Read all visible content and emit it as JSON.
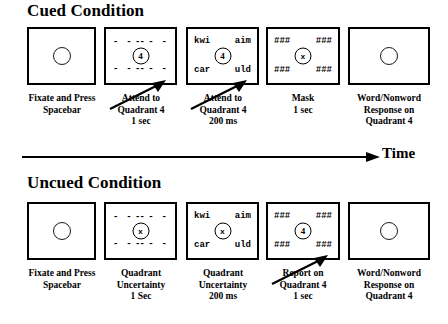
{
  "figure": {
    "time_axis_label": "Time"
  },
  "cued": {
    "title": "Cued Condition",
    "panels": [
      {
        "name": "fixation",
        "kind": "fixation",
        "center": "",
        "caption": "Fixate and Press\nSpacebar"
      },
      {
        "name": "cue",
        "kind": "dashes",
        "center": "4",
        "dashes": "- - -",
        "caption": "Attend to\nQuadrant 4\n1 sec"
      },
      {
        "name": "stimulus",
        "kind": "words",
        "center": "4",
        "words": {
          "top_left": "kwi",
          "top_right": "aim",
          "bottom_left": "car",
          "bottom_right": "uld"
        },
        "caption": "Attend to\nQuadrant 4\n200 ms"
      },
      {
        "name": "mask",
        "kind": "mask",
        "center": "x",
        "mask_token": "###",
        "caption": "Mask\n1 sec"
      },
      {
        "name": "response",
        "kind": "fixation",
        "center": "",
        "caption": "Word/Nonword\nResponse on\nQuadrant 4"
      }
    ]
  },
  "uncued": {
    "title": "Uncued Condition",
    "panels": [
      {
        "name": "fixation",
        "kind": "fixation",
        "center": "",
        "caption": "Fixate and Press\nSpacebar"
      },
      {
        "name": "cue",
        "kind": "dashes",
        "center": "x",
        "dashes": "- - -",
        "caption": "Quadrant\nUncertainty\n1 Sec"
      },
      {
        "name": "stimulus",
        "kind": "words",
        "center": "x",
        "words": {
          "top_left": "kwi",
          "top_right": "aim",
          "bottom_left": "car",
          "bottom_right": "uld"
        },
        "caption": "Quadrant\nUncertainty\n200 ms"
      },
      {
        "name": "mask",
        "kind": "mask",
        "center": "4",
        "mask_token": "###",
        "caption": "Report on\nQuadrant 4\n1 sec"
      },
      {
        "name": "response",
        "kind": "fixation",
        "center": "",
        "caption": "Word/Nonword\nResponse on\nQuadrant 4"
      }
    ]
  }
}
